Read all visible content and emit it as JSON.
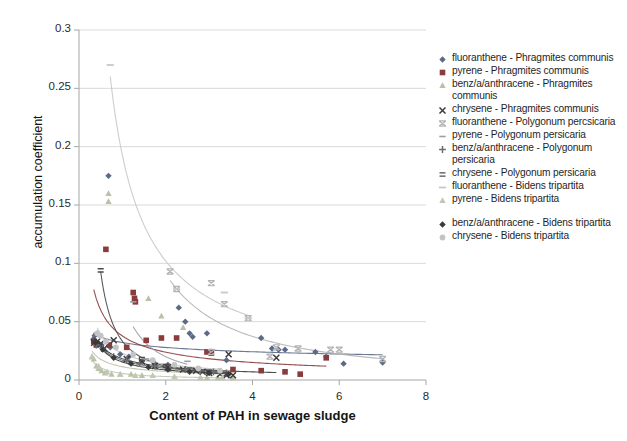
{
  "chart_data": {
    "type": "scatter",
    "title": "",
    "xlabel": "Content of PAH in sewage sludge",
    "ylabel": "accumulation coefficient",
    "xlim": [
      0,
      8
    ],
    "ylim": [
      0,
      0.3
    ],
    "xticks": [
      "0",
      "2",
      "4",
      "6",
      "8"
    ],
    "xtick_values": [
      0,
      2,
      4,
      6,
      8
    ],
    "yticks": [
      "0",
      "0.05",
      "0.1",
      "0.15",
      "0.2",
      "0.25",
      "0.3"
    ],
    "ytick_values": [
      0,
      0.05,
      0.1,
      0.15,
      0.2,
      0.25,
      0.3
    ],
    "grid": "horizontal",
    "legend_position": "right",
    "trendlines": "power-decay fit per series",
    "series": [
      {
        "name": "fluoranthene - Phragmites communis",
        "marker": "diamond",
        "color": "#5b6a86",
        "points": [
          [
            0.33,
            0.035
          ],
          [
            0.36,
            0.038
          ],
          [
            0.42,
            0.04
          ],
          [
            0.47,
            0.031
          ],
          [
            0.52,
            0.03
          ],
          [
            0.68,
            0.175
          ],
          [
            0.72,
            0.028
          ],
          [
            0.95,
            0.022
          ],
          [
            1.15,
            0.02
          ],
          [
            1.45,
            0.016
          ],
          [
            1.75,
            0.014
          ],
          [
            2.05,
            0.013
          ],
          [
            2.3,
            0.062
          ],
          [
            2.45,
            0.05
          ],
          [
            2.55,
            0.04
          ],
          [
            2.62,
            0.037
          ],
          [
            2.95,
            0.04
          ],
          [
            3.05,
            0.024
          ],
          [
            3.4,
            0.017
          ],
          [
            4.2,
            0.036
          ],
          [
            4.45,
            0.027
          ],
          [
            4.6,
            0.026
          ],
          [
            4.75,
            0.026
          ],
          [
            5.45,
            0.024
          ],
          [
            5.7,
            0.02
          ],
          [
            6.1,
            0.014
          ],
          [
            7.0,
            0.015
          ]
        ]
      },
      {
        "name": "pyrene - Phragmites communis",
        "marker": "square",
        "color": "#8a3b3b",
        "points": [
          [
            0.34,
            0.033
          ],
          [
            0.4,
            0.03
          ],
          [
            0.62,
            0.112
          ],
          [
            0.7,
            0.03
          ],
          [
            1.1,
            0.028
          ],
          [
            1.25,
            0.075
          ],
          [
            1.28,
            0.07
          ],
          [
            1.3,
            0.067
          ],
          [
            1.55,
            0.034
          ],
          [
            1.9,
            0.036
          ],
          [
            2.25,
            0.036
          ],
          [
            2.95,
            0.024
          ],
          [
            3.05,
            0.023
          ],
          [
            3.55,
            0.009
          ],
          [
            4.2,
            0.008
          ],
          [
            4.75,
            0.007
          ],
          [
            5.1,
            0.005
          ],
          [
            5.7,
            0.019
          ]
        ]
      },
      {
        "name": "benz/a/anthracene - Phragmites communis",
        "marker": "triangle",
        "color": "#b9c2a8",
        "points": [
          [
            0.3,
            0.02
          ],
          [
            0.34,
            0.018
          ],
          [
            0.4,
            0.012
          ],
          [
            0.45,
            0.01
          ],
          [
            0.52,
            0.008
          ],
          [
            0.6,
            0.006
          ],
          [
            0.68,
            0.16
          ],
          [
            0.68,
            0.153
          ],
          [
            0.75,
            0.005
          ],
          [
            0.95,
            0.005
          ],
          [
            1.2,
            0.005
          ],
          [
            1.45,
            0.004
          ],
          [
            1.6,
            0.07
          ],
          [
            1.9,
            0.055
          ],
          [
            2.4,
            0.045
          ],
          [
            2.8,
            0.002
          ],
          [
            2.95,
            0.002
          ],
          [
            3.2,
            0.002
          ],
          [
            3.55,
            0.002
          ]
        ]
      },
      {
        "name": "chrysene - Phragmites communis",
        "marker": "x",
        "color": "#3b3b3b",
        "points": [
          [
            0.35,
            0.032
          ],
          [
            0.42,
            0.033
          ],
          [
            0.5,
            0.031
          ],
          [
            0.58,
            0.027
          ],
          [
            0.8,
            0.034
          ],
          [
            1.1,
            0.018
          ],
          [
            1.45,
            0.016
          ],
          [
            1.75,
            0.012
          ],
          [
            2.05,
            0.011
          ],
          [
            2.4,
            0.009
          ],
          [
            2.7,
            0.008
          ],
          [
            2.85,
            0.007
          ],
          [
            3.0,
            0.006
          ],
          [
            3.25,
            0.005
          ],
          [
            3.4,
            0.004
          ],
          [
            3.45,
            0.022
          ],
          [
            3.55,
            0.004
          ],
          [
            4.55,
            0.019
          ]
        ]
      },
      {
        "name": "fluoranthene - Polygonum percsicaria",
        "marker": "star",
        "color": "#b3b3b3",
        "points": [
          [
            2.1,
            0.093
          ],
          [
            2.25,
            0.078
          ],
          [
            3.05,
            0.083
          ],
          [
            3.35,
            0.065
          ],
          [
            3.9,
            0.053
          ],
          [
            4.55,
            0.028
          ],
          [
            5.05,
            0.027
          ],
          [
            5.8,
            0.026
          ],
          [
            6.0,
            0.026
          ],
          [
            7.0,
            0.018
          ],
          [
            3.05,
            0.024
          ],
          [
            4.4,
            0.02
          ]
        ]
      },
      {
        "name": "pyrene - Polygonum persicaria",
        "marker": "none",
        "color": "#9aa0a8",
        "points": [
          [
            1.25,
            0.067
          ],
          [
            1.55,
            0.018
          ],
          [
            2.5,
            0.016
          ]
        ]
      },
      {
        "name": "benz/a/anthracene - Polygonum persicaria",
        "marker": "plus",
        "color": "#6d6d6d",
        "points": [
          [
            0.4,
            0.03
          ],
          [
            0.55,
            0.027
          ],
          [
            0.8,
            0.02
          ],
          [
            1.1,
            0.017
          ],
          [
            1.4,
            0.014
          ],
          [
            1.75,
            0.012
          ],
          [
            2.1,
            0.01
          ],
          [
            2.45,
            0.009
          ],
          [
            2.8,
            0.008
          ],
          [
            3.1,
            0.007
          ],
          [
            3.4,
            0.006
          ]
        ]
      },
      {
        "name": "chrysene - Polygonum persicaria",
        "marker": "equals",
        "color": "#4a4a4a",
        "points": [
          [
            0.5,
            0.094
          ],
          [
            1.45,
            0.018
          ],
          [
            2.0,
            0.012
          ],
          [
            2.55,
            0.009
          ],
          [
            3.0,
            0.007
          ],
          [
            3.4,
            0.005
          ]
        ]
      },
      {
        "name": "fluoranthene - Bidens tripartita",
        "marker": "dash",
        "color": "#c8c8c8",
        "points": [
          [
            0.72,
            0.27
          ],
          [
            2.25,
            0.078
          ],
          [
            3.35,
            0.075
          ],
          [
            3.9,
            0.053
          ]
        ]
      },
      {
        "name": "pyrene - Bidens tripartita",
        "marker": "triangle",
        "color": "#c0c7b4",
        "points": [
          [
            0.3,
            0.02
          ],
          [
            0.45,
            0.012
          ],
          [
            0.65,
            0.007
          ],
          [
            0.95,
            0.005
          ],
          [
            1.3,
            0.004
          ],
          [
            1.7,
            0.004
          ],
          [
            2.2,
            0.003
          ],
          [
            2.8,
            0.002
          ],
          [
            3.3,
            0.002
          ]
        ]
      },
      {
        "name": "benz/a/anthracene - Bidens tripartita",
        "marker": "diamond-filled",
        "color": "#3a3a3a",
        "points": [
          [
            0.38,
            0.032
          ],
          [
            0.55,
            0.026
          ],
          [
            0.8,
            0.019
          ],
          [
            1.2,
            0.014
          ],
          [
            1.6,
            0.011
          ],
          [
            2.05,
            0.009
          ],
          [
            2.55,
            0.007
          ],
          [
            3.0,
            0.006
          ],
          [
            3.45,
            0.005
          ]
        ]
      },
      {
        "name": "chrysene - Bidens tripartita",
        "marker": "circle",
        "color": "#c4c4c4",
        "points": [
          [
            0.42,
            0.04
          ],
          [
            0.5,
            0.038
          ],
          [
            0.62,
            0.033
          ],
          [
            0.85,
            0.028
          ],
          [
            1.25,
            0.022
          ],
          [
            1.7,
            0.017
          ],
          [
            2.2,
            0.013
          ],
          [
            2.75,
            0.01
          ],
          [
            3.25,
            0.008
          ]
        ]
      }
    ]
  },
  "axes": {
    "y_title": "accumulation coefficient",
    "x_title": "Content of PAH in sewage sludge",
    "y_ticks": [
      "0.3",
      "0.25",
      "0.2",
      "0.15",
      "0.1",
      "0.05",
      "0"
    ],
    "x_ticks": [
      "0",
      "2",
      "4",
      "6",
      "8"
    ]
  },
  "legend": {
    "items": [
      {
        "label": "fluoranthene - Phragmites communis",
        "marker": "diamond",
        "color": "#5b6a86"
      },
      {
        "label": "pyrene - Phragmites communis",
        "marker": "square",
        "color": "#8a3b3b"
      },
      {
        "label": "benz/a/anthracene - Phragmites communis",
        "marker": "triangle",
        "color": "#b9c2a8"
      },
      {
        "label": "chrysene - Phragmites communis",
        "marker": "x",
        "color": "#3b3b3b"
      },
      {
        "label": "fluoranthene - Polygonum percsicaria",
        "marker": "star",
        "color": "#b3b3b3"
      },
      {
        "label": "pyrene - Polygonum persicaria",
        "marker": "none",
        "color": "#9aa0a8"
      },
      {
        "label": "benz/a/anthracene - Polygonum persicaria",
        "marker": "plus",
        "color": "#6d6d6d"
      },
      {
        "label": "chrysene - Polygonum persicaria",
        "marker": "equals",
        "color": "#4a4a4a"
      },
      {
        "label": "fluoranthene - Bidens tripartita",
        "marker": "dash",
        "color": "#c8c8c8"
      },
      {
        "label": "pyrene - Bidens tripartita",
        "marker": "triangle",
        "color": "#c0c7b4"
      },
      {
        "label": "benz/a/anthracene - Bidens tripartita",
        "marker": "diamond-filled",
        "color": "#3a3a3a"
      },
      {
        "label": "chrysene - Bidens tripartita",
        "marker": "circle",
        "color": "#c4c4c4"
      }
    ]
  },
  "style": {
    "background": "#ffffff",
    "gridline": "#d9d9d9",
    "axisline": "#a6a6a6",
    "text": "#1f1f1f"
  }
}
